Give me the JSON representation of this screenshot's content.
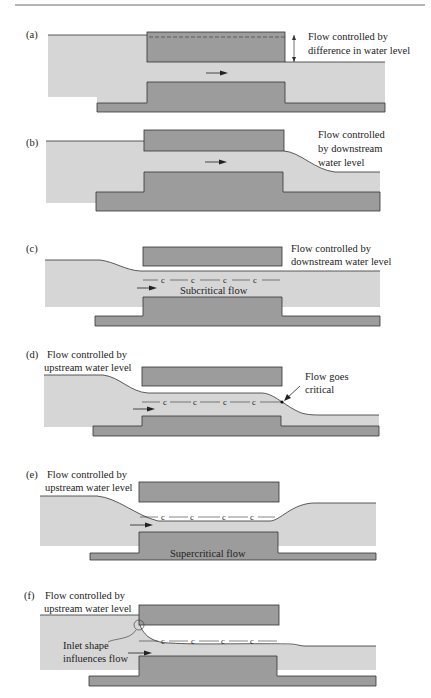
{
  "figure": {
    "colors": {
      "water": "#d6d6d6",
      "structure": "#9c9c9c",
      "line": "#333333",
      "text": "#222222"
    },
    "panels": [
      {
        "id": "a",
        "tag": "(a)",
        "labels": [
          "Flow controlled by",
          "difference in water level"
        ]
      },
      {
        "id": "b",
        "tag": "(b)",
        "labels": [
          "Flow controlled",
          "by downstream",
          "water level"
        ]
      },
      {
        "id": "c",
        "tag": "(c)",
        "labels": [
          "Flow controlled by",
          "downstream water level"
        ],
        "flow_label": "Subcritical flow",
        "critical_marks": [
          "c",
          "c",
          "c",
          "c"
        ]
      },
      {
        "id": "d",
        "tag": "(d)",
        "labels": [
          "Flow controlled by",
          "upstream water level"
        ],
        "callout": [
          "Flow goes",
          "critical"
        ],
        "critical_marks": [
          "c",
          "c",
          "c",
          "c"
        ]
      },
      {
        "id": "e",
        "tag": "(e)",
        "labels": [
          "Flow controlled by",
          "upstream water level"
        ],
        "flow_label": "Supercritical flow",
        "critical_marks": [
          "c",
          "c",
          "c",
          "c"
        ]
      },
      {
        "id": "f",
        "tag": "(f)",
        "labels": [
          "Flow controlled by",
          "upstream water level"
        ],
        "callout": [
          "Inlet shape",
          "influences flow"
        ],
        "critical_marks": [
          "c",
          "c",
          "c",
          "c"
        ]
      }
    ],
    "icons": {
      "flow_arrow": "right-arrow-icon"
    }
  }
}
